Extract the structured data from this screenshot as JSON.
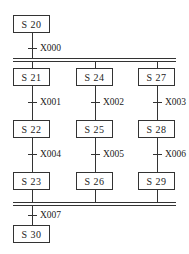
{
  "steps": {
    "s20": "S  20",
    "s21": "S  21",
    "s24": "S  24",
    "s27": "S  27",
    "s22": "S  22",
    "s25": "S  25",
    "s28": "S  28",
    "s23": "S  23",
    "s26": "S  26",
    "s29": "S  29",
    "s30": "S  30"
  },
  "transitions": {
    "x000": "X000",
    "x001": "X001",
    "x002": "X002",
    "x003": "X003",
    "x004": "X004",
    "x005": "X005",
    "x006": "X006",
    "x007": "X007"
  }
}
